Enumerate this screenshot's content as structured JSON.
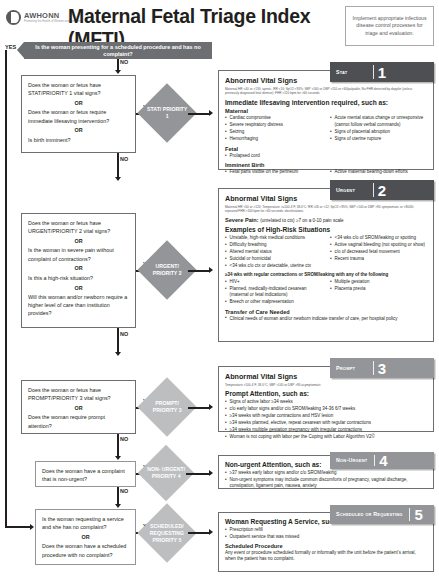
{
  "header": {
    "logo_name": "AWHONN",
    "logo_tagline": "Promoting the Health of Women and Newborns",
    "logo_tagline2": "",
    "title": "Maternal Fetal Triage Index (MFTI)",
    "infection_note": "Implement appropriate infectious disease control processes for triage and evaluation."
  },
  "topbar": {
    "yes_label": "YES",
    "question": "Is the woman presenting for a scheduled procedure and has no complaint?"
  },
  "flow": {
    "labels": {
      "yes": "YES",
      "no": "NO",
      "or": "OR"
    },
    "decisions": [
      {
        "id": "stat",
        "lines": [
          "Does the woman or fetus have STAT/PRIORITY 1 vital signs?",
          "Does the woman or fetus require immediate lifesaving intervention?",
          "Is birth imminent?"
        ],
        "outcome": "STAT/ PRIORITY 1"
      },
      {
        "id": "urgent",
        "lines": [
          "Does the woman or fetus have URGENT/PRIORITY 2 vital signs?",
          "Is the woman in severe pain without complaint of contractions?",
          "Is this a high-risk situation?",
          "Will this woman and/or newborn require a higher level of care than institution provides?"
        ],
        "outcome": "URGENT/ PRIORITY 2"
      },
      {
        "id": "prompt",
        "lines": [
          "Does the woman or fetus have PROMPT/PRIORITY 3 vital signs?",
          "Does the woman require prompt attention?"
        ],
        "outcome": "PROMPT/ PRIORITY 3"
      },
      {
        "id": "nonurgent",
        "lines": [
          "Does the woman have a complaint that is non-urgent?"
        ],
        "outcome": "NON- URGENT/ PRIORITY 4"
      },
      {
        "id": "scheduled",
        "lines": [
          "Is the woman requesting a service and she has no complaint?",
          "Does the woman have a scheduled procedure with no complaint?"
        ],
        "outcome": "SCHEDULED/ REQUESTING PRIORITY 5"
      }
    ]
  },
  "panels": [
    {
      "id": "p1",
      "tab_label": "Stat",
      "tab_number": "1",
      "tab_style": "dark",
      "vital_heading": "Abnormal Vital Signs",
      "vital_detail": "Maternal HR <40 or >130; apneic, RR <10; SpO2 <93%; SBP >160 or DBP >110 or <60/palpable, No FHR detected by doppler (unless previously diagnosed fetal demise); FHR <110 bpm for >60 seconds",
      "section_heading": "Immediate lifesaving intervention required, such as:",
      "groups": [
        {
          "title": "Maternal",
          "left": [
            "Cardiac compromise",
            "Severe respiratory distress",
            "Seizing",
            "Hemorrhaging"
          ],
          "right": [
            "Acute mental status change or unresponsive (cannot follow verbal commands)",
            "Signs of placental abruption",
            "Signs of uterine rupture"
          ]
        },
        {
          "title": "Fetal",
          "left": [
            "Prolapsed cord"
          ],
          "right": []
        },
        {
          "title": "Imminent Birth",
          "left": [
            "Fetal parts visible on the perineum"
          ],
          "right": [
            "Active maternal bearing-down efforts"
          ]
        }
      ]
    },
    {
      "id": "p2",
      "tab_label": "Urgent",
      "tab_number": "2",
      "tab_style": "dark",
      "vital_heading": "Abnormal Vital Signs",
      "vital_detail": "Maternal HR <50 or >120; Temperature >=100.4°F, 38.0°C; RR >26 or <12; SpO2 <95%; SBP >140 or DBP >90 symptomatic or <80/40; repeated FHR >160 bpm for >60 seconds; decelerations",
      "severe_pain_label": "Severe Pain:",
      "severe_pain_text": "(unrelated to ctx) ≥7 on a 0-10 pain scale",
      "section_heading": "Examples of High-Risk Situations",
      "left": [
        "Unstable, high-risk medical conditions",
        "Difficulty breathing",
        "Altered mental status",
        "Suicidal or homicidal",
        "<34 wks c/o ctx or detectable, uterine ctx"
      ],
      "right": [
        "<34 wks c/o of SROM/leaking or spotting",
        "Active vaginal bleeding (not spotting or show)",
        "c/o of decreased fetal movement",
        "Recent trauma"
      ],
      "note": "≥34 wks with regular contractions or SROM/leaking with any of the following",
      "note_left": [
        "HIV+",
        "Planned, medically-indicated cesarean (maternal or fetal indications)",
        "Breech or other malpresentation"
      ],
      "note_right": [
        "Multiple gestation",
        "Placenta previa"
      ],
      "transfer_heading": "Transfer of Care Needed",
      "transfer_items": [
        "Clinical needs of woman and/or newborn indicate transfer of care, per hospital policy"
      ]
    },
    {
      "id": "p3",
      "tab_label": "Prompt",
      "tab_number": "3",
      "tab_style": "gray",
      "vital_heading": "Abnormal Vital Signs",
      "vital_detail": "Temperature >100.4°F, 38.0°C; SBP >140 or DBP >90 asymptomatic",
      "section_heading": "Prompt Attention, such as:",
      "items": [
        "Signs of active labor ≥34 weeks",
        "c/o early labor signs and/or c/o SROM/leaking 34-36 6/7 weeks",
        "≥34 weeks with regular contractions and HSV lesion",
        "≥34 weeks planned, elective, repeat cesarean with regular contractions",
        "≥34 weeks multiple gestation pregnancy with irregular contractions",
        "Woman is not coping with labor per the Coping with Labor Algorithm V2©"
      ]
    },
    {
      "id": "p4",
      "tab_label": "Non-Urgent",
      "tab_number": "4",
      "tab_style": "gray",
      "section_heading": "Non-urgent Attention, such as:",
      "items": [
        "≥37 weeks early labor signs and/or c/o SROM/leaking",
        "Non-urgent symptoms may include common discomforts of pregnancy, vaginal discharge, constipation, ligament pain, nausea, anxiety"
      ]
    },
    {
      "id": "p5",
      "tab_label": "Scheduled or Requesting",
      "tab_number": "5",
      "tab_style": "gray",
      "section_heading": "Woman Requesting A Service, such as:",
      "items": [
        "Prescription refill",
        "Outpatient service that was missed"
      ],
      "sub_heading": "Scheduled Procedure",
      "sub_text": "Any event or procedure scheduled formally or informally with the unit before the patient's arrival, when the patient has no complaint."
    }
  ]
}
